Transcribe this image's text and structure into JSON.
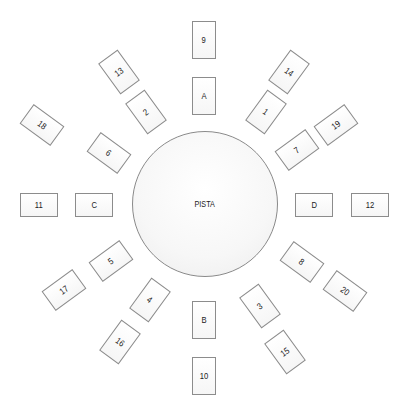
{
  "diagram": {
    "center_label": "PISTA",
    "tables": [
      {
        "label": "9",
        "x": 204,
        "y": 40,
        "rot": 0,
        "orient": "v"
      },
      {
        "label": "A",
        "x": 204,
        "y": 96,
        "rot": 0,
        "orient": "v"
      },
      {
        "label": "13",
        "x": 119,
        "y": 72,
        "rot": -36,
        "orient": "v"
      },
      {
        "label": "2",
        "x": 146,
        "y": 112,
        "rot": -36,
        "orient": "v"
      },
      {
        "label": "14",
        "x": 289,
        "y": 72,
        "rot": 36,
        "orient": "v"
      },
      {
        "label": "1",
        "x": 266,
        "y": 112,
        "rot": 36,
        "orient": "v"
      },
      {
        "label": "18",
        "x": 42,
        "y": 125,
        "rot": 36,
        "orient": "h"
      },
      {
        "label": "6",
        "x": 109,
        "y": 153,
        "rot": 36,
        "orient": "h"
      },
      {
        "label": "19",
        "x": 336,
        "y": 125,
        "rot": -36,
        "orient": "h"
      },
      {
        "label": "7",
        "x": 297,
        "y": 150,
        "rot": -36,
        "orient": "h"
      },
      {
        "label": "11",
        "x": 39,
        "y": 205,
        "rot": 0,
        "orient": "h"
      },
      {
        "label": "C",
        "x": 94,
        "y": 205,
        "rot": 0,
        "orient": "h"
      },
      {
        "label": "D",
        "x": 314,
        "y": 205,
        "rot": 0,
        "orient": "h"
      },
      {
        "label": "12",
        "x": 370,
        "y": 205,
        "rot": 0,
        "orient": "h"
      },
      {
        "label": "5",
        "x": 111,
        "y": 261,
        "rot": -36,
        "orient": "h"
      },
      {
        "label": "17",
        "x": 64,
        "y": 290,
        "rot": -36,
        "orient": "h"
      },
      {
        "label": "8",
        "x": 302,
        "y": 262,
        "rot": 36,
        "orient": "h"
      },
      {
        "label": "20",
        "x": 345,
        "y": 291,
        "rot": 36,
        "orient": "h"
      },
      {
        "label": "4",
        "x": 150,
        "y": 300,
        "rot": 36,
        "orient": "v"
      },
      {
        "label": "16",
        "x": 120,
        "y": 342,
        "rot": 36,
        "orient": "v"
      },
      {
        "label": "B",
        "x": 204,
        "y": 320,
        "rot": 0,
        "orient": "v"
      },
      {
        "label": "10",
        "x": 204,
        "y": 376,
        "rot": 0,
        "orient": "v"
      },
      {
        "label": "3",
        "x": 260,
        "y": 306,
        "rot": -36,
        "orient": "v"
      },
      {
        "label": "15",
        "x": 285,
        "y": 352,
        "rot": -36,
        "orient": "v"
      }
    ]
  }
}
